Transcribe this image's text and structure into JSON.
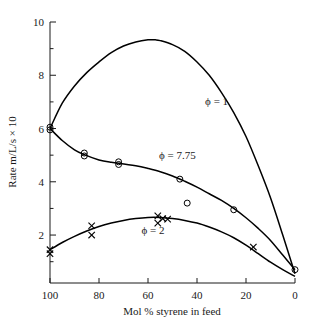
{
  "chart_data": {
    "type": "line",
    "title": "",
    "xlabel": "Mol % styrene in feed",
    "ylabel": "Rate m/L/s × 10",
    "xlim": [
      100,
      0
    ],
    "ylim": [
      0.2,
      10
    ],
    "x_reversed": true,
    "grid": false,
    "legend_position": "inline-annotations",
    "xticks": [
      100,
      80,
      60,
      40,
      20,
      0
    ],
    "xtick_labels": [
      "100",
      "80",
      "60",
      "40",
      "20",
      "0"
    ],
    "yticks": [
      2,
      4,
      6,
      8,
      10
    ],
    "ytick_labels": [
      "2",
      "4",
      "6",
      "8",
      "10"
    ],
    "y_minor_ticks": [
      1,
      3,
      5,
      7,
      9
    ],
    "series": [
      {
        "name": "ϕ = 1",
        "label": "ϕ = 1",
        "label_x": 32,
        "label_y": 6.9,
        "marker": "none",
        "x": [
          100,
          95,
          90,
          85,
          80,
          75,
          70,
          65,
          60,
          57,
          55,
          50,
          45,
          40,
          35,
          30,
          25,
          20,
          15,
          10,
          5,
          0
        ],
        "y": [
          6.0,
          6.95,
          7.6,
          8.1,
          8.5,
          8.85,
          9.1,
          9.25,
          9.33,
          9.33,
          9.3,
          9.15,
          8.9,
          8.5,
          8.0,
          7.35,
          6.6,
          5.7,
          4.6,
          3.4,
          2.0,
          0.55
        ],
        "points_x": [],
        "points_y": []
      },
      {
        "name": "ϕ = 7.75",
        "label": "ϕ = 7.75",
        "label_x": 48,
        "label_y": 4.85,
        "marker": "circle",
        "x": [
          100,
          95,
          90,
          86,
          80,
          75,
          72,
          65,
          60,
          55,
          50,
          45,
          40,
          35,
          30,
          25,
          20,
          15,
          10,
          5,
          0
        ],
        "y": [
          6.0,
          5.55,
          5.2,
          5.02,
          4.82,
          4.73,
          4.7,
          4.6,
          4.5,
          4.38,
          4.22,
          4.02,
          3.8,
          3.55,
          3.3,
          3.0,
          2.65,
          2.25,
          1.8,
          1.25,
          0.7
        ],
        "points_x": [
          100,
          100,
          86,
          86,
          72,
          72,
          47,
          44,
          25,
          0
        ],
        "points_y": [
          6.05,
          5.95,
          5.08,
          4.97,
          4.75,
          4.65,
          4.1,
          3.2,
          2.95,
          0.7
        ]
      },
      {
        "name": "ϕ = 2",
        "label": "ϕ = 2",
        "label_x": 58,
        "label_y": 2.05,
        "marker": "cross",
        "x": [
          100,
          95,
          90,
          85,
          80,
          75,
          70,
          65,
          60,
          55,
          50,
          45,
          40,
          35,
          30,
          25,
          20,
          15,
          10,
          5,
          0
        ],
        "y": [
          1.45,
          1.72,
          1.95,
          2.15,
          2.32,
          2.45,
          2.55,
          2.62,
          2.66,
          2.66,
          2.62,
          2.55,
          2.45,
          2.3,
          2.12,
          1.9,
          1.62,
          1.3,
          0.98,
          0.7,
          0.45
        ],
        "points_x": [
          100,
          100,
          83,
          83,
          56,
          56,
          54,
          52,
          17
        ],
        "points_y": [
          1.45,
          1.3,
          2.35,
          2.0,
          2.72,
          2.45,
          2.62,
          2.6,
          1.55
        ]
      }
    ]
  },
  "axes": {
    "x_axis_name": "x-axis",
    "y_axis_name": "y-axis"
  }
}
